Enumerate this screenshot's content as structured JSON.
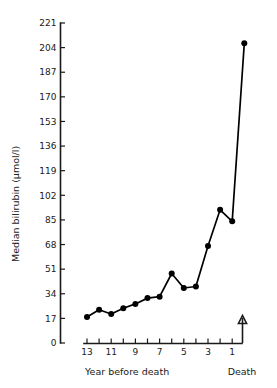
{
  "chart_data": {
    "type": "line",
    "title": "",
    "xlabel": "Year before death",
    "ylabel": "Median bilirubin  (µmol/l)",
    "ylim": [
      0,
      221
    ],
    "y_ticks": [
      0,
      17,
      34,
      51,
      68,
      85,
      102,
      119,
      136,
      153,
      170,
      187,
      204,
      221
    ],
    "x_tick_labels": [
      "13",
      "",
      "11",
      "",
      "9",
      "",
      "7",
      "",
      "5",
      "",
      "3",
      "",
      "1"
    ],
    "x_categories": [
      "13",
      "12",
      "11",
      "10",
      "9",
      "8",
      "7",
      "6",
      "5",
      "4",
      "3",
      "2",
      "1",
      "Death"
    ],
    "x_end_label": "Death",
    "grid": false,
    "legend": false,
    "marker": "filled-circle",
    "line_color": "#000000",
    "values": [
      18,
      23,
      20,
      24,
      27,
      31,
      32,
      48,
      38,
      39,
      67,
      92,
      84,
      207
    ],
    "series": [
      {
        "name": "Median bilirubin",
        "points": [
          {
            "x": "13",
            "y": 18
          },
          {
            "x": "12",
            "y": 23
          },
          {
            "x": "11",
            "y": 20
          },
          {
            "x": "10",
            "y": 24
          },
          {
            "x": "9",
            "y": 27
          },
          {
            "x": "8",
            "y": 31
          },
          {
            "x": "7",
            "y": 32
          },
          {
            "x": "6",
            "y": 48
          },
          {
            "x": "5",
            "y": 38
          },
          {
            "x": "4",
            "y": 39
          },
          {
            "x": "3",
            "y": 67
          },
          {
            "x": "2",
            "y": 92
          },
          {
            "x": "1",
            "y": 84
          },
          {
            "x": "Death",
            "y": 207
          }
        ]
      }
    ]
  },
  "axes": {
    "y_axis_label": "Median bilirubin  (µmol/l)",
    "x_axis_label": "Year before death",
    "death_marker_label": "Death"
  }
}
